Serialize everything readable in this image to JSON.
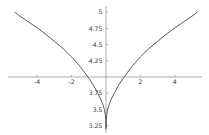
{
  "chart_data": {
    "type": "line",
    "title": "",
    "subtitle": "",
    "xlabel": "",
    "ylabel": "",
    "xlim": [
      -5.35,
      5.35
    ],
    "ylim": [
      3.18,
      5.02
    ],
    "grid": false,
    "legend": null,
    "axis_style": "centered-cross",
    "x_axis_value": 4.0,
    "y_axis_value": 0.0,
    "xticks": [
      -4,
      -2,
      2,
      4
    ],
    "xticklabels": [
      "-4",
      "-2",
      "2",
      "4"
    ],
    "yticks": [
      3.25,
      3.5,
      3.75,
      4.25,
      4.5,
      4.75,
      5
    ],
    "yticklabels": [
      "3.25",
      "3.5",
      "3.75",
      "4.25",
      "4.5",
      "4.75",
      "5"
    ],
    "series": [
      {
        "name": "curve",
        "color": "#4a4a4a",
        "x": [
          -5.3,
          -5.0,
          -4.5,
          -4.0,
          -3.5,
          -3.0,
          -2.5,
          -2.0,
          -1.5,
          -1.0,
          -0.75,
          -0.5,
          -0.35,
          -0.2,
          -0.1,
          -0.04,
          -0.01,
          0.0,
          0.01,
          0.04,
          0.1,
          0.2,
          0.35,
          0.5,
          0.75,
          1.0,
          1.5,
          2.0,
          2.5,
          3.0,
          3.5,
          4.0,
          4.5,
          5.0,
          5.3
        ],
        "y": [
          5.0,
          4.94,
          4.85,
          4.76,
          4.66,
          4.55,
          4.44,
          4.31,
          4.16,
          3.98,
          3.88,
          3.76,
          3.68,
          3.59,
          3.5,
          3.42,
          3.33,
          3.2,
          3.33,
          3.42,
          3.5,
          3.59,
          3.68,
          3.76,
          3.88,
          3.98,
          4.16,
          4.31,
          4.44,
          4.55,
          4.66,
          4.76,
          4.85,
          4.94,
          5.0
        ]
      }
    ],
    "axis_color": "#8a8a8a",
    "tick_color": "#8a8a8a",
    "background": "#ffffff"
  }
}
